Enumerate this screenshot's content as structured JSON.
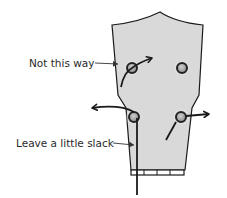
{
  "diagram": {
    "labels": {
      "not_this_way": "Not this way",
      "leave_slack": "Leave a little slack"
    },
    "colors": {
      "headstock_fill": "#d9d9d9",
      "outline": "#1a1a1a",
      "peg_ring": "#2a2a2a",
      "background": "#ffffff"
    },
    "pegs": [
      {
        "id": "top-left",
        "note": "wrong direction example"
      },
      {
        "id": "top-right"
      },
      {
        "id": "bottom-left",
        "note": "string with slack"
      },
      {
        "id": "bottom-right"
      }
    ]
  }
}
